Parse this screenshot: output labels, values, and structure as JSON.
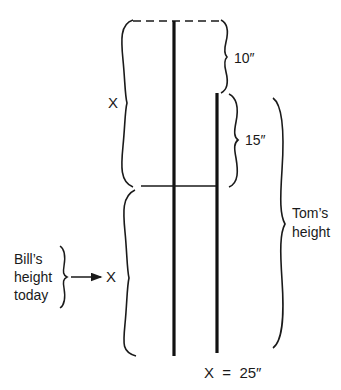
{
  "diagram": {
    "title": "",
    "elements": {
      "left_pole": {
        "name": "pole-x-plus-x",
        "x": 174,
        "y1": 21,
        "y2": 356
      },
      "right_pole": {
        "name": "pole-toms-height",
        "x": 217,
        "y1": 93,
        "y2": 353
      },
      "dashed_top_line": {
        "x1": 133,
        "x2": 222,
        "y": 21
      },
      "horizontal_divider": {
        "x1": 141,
        "x2": 216,
        "y": 186
      }
    },
    "labels": {
      "upper_x": "X",
      "lower_x": "X",
      "ten_inches": "10″",
      "fifteen_inches": "15″",
      "toms_height_line1": "Tom’s",
      "toms_height_line2": "height",
      "bills_line1": "Bill’s",
      "bills_line2": "height",
      "bills_line3": "today",
      "solution": "X  =  25″"
    },
    "colors": {
      "ink": "#1a1a1a",
      "background": "#ffffff"
    }
  }
}
